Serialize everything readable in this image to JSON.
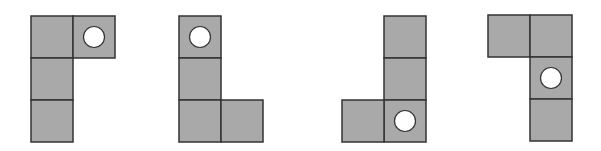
{
  "diagram": {
    "colors": {
      "fill": "#a9a9a9",
      "stroke": "#333333",
      "circle": "#ffffff",
      "background": "#ffffff"
    },
    "cell_size": 42,
    "shapes": [
      {
        "name": "shape-1",
        "origin": [
          31,
          16
        ],
        "cells": [
          [
            0,
            0
          ],
          [
            1,
            0
          ],
          [
            0,
            1
          ],
          [
            0,
            2
          ]
        ],
        "circle_cell": [
          1,
          0
        ]
      },
      {
        "name": "shape-2",
        "origin": [
          179,
          16
        ],
        "cells": [
          [
            0,
            0
          ],
          [
            0,
            1
          ],
          [
            0,
            2
          ],
          [
            1,
            2
          ]
        ],
        "circle_cell": [
          0,
          0
        ]
      },
      {
        "name": "shape-3",
        "origin": [
          342,
          16
        ],
        "cells": [
          [
            1,
            0
          ],
          [
            1,
            1
          ],
          [
            1,
            2
          ],
          [
            0,
            2
          ]
        ],
        "circle_cell": [
          1,
          2
        ]
      },
      {
        "name": "shape-4",
        "origin": [
          488,
          15
        ],
        "cells": [
          [
            0,
            0
          ],
          [
            1,
            0
          ],
          [
            1,
            1
          ],
          [
            1,
            2
          ]
        ],
        "circle_cell": [
          1,
          1
        ]
      }
    ]
  }
}
